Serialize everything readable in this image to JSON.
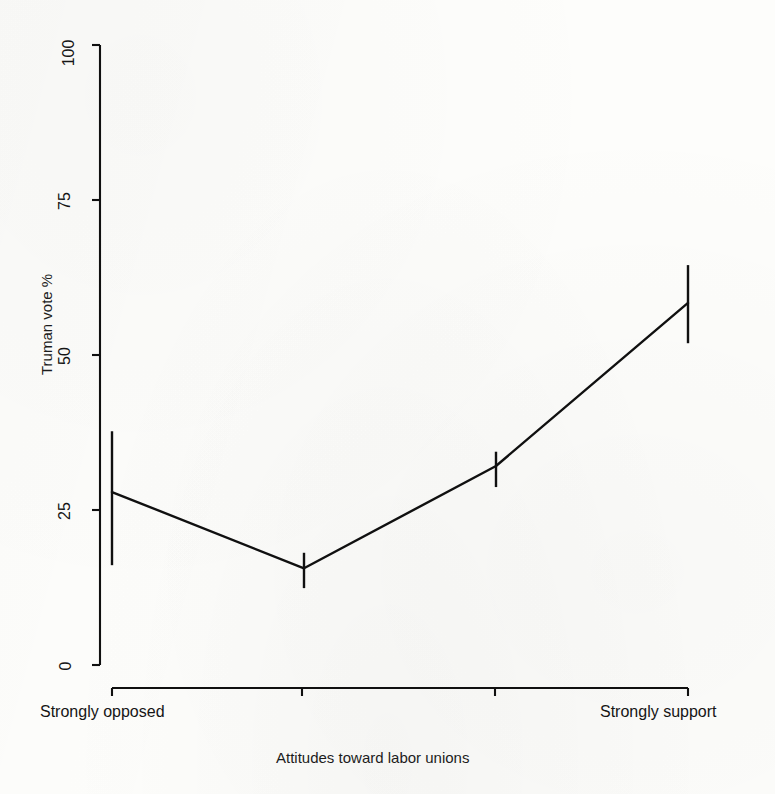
{
  "chart_data": {
    "type": "line",
    "title": "",
    "subtitle": "",
    "xlabel": "Attitudes toward labor unions",
    "ylabel": "Truman vote %",
    "grid": false,
    "legend": "none",
    "error_bars": "vertical confidence intervals",
    "xlim": [
      1,
      4
    ],
    "ylim": [
      0,
      100
    ],
    "yticks": [
      0,
      25,
      50,
      75,
      100
    ],
    "ytick_labels": [
      "0",
      "25",
      "50",
      "75",
      "100"
    ],
    "xticks": [
      1,
      2,
      3,
      4
    ],
    "xtick_labels": [
      "",
      "",
      "",
      ""
    ],
    "x_end_labels": {
      "left": "Strongly opposed",
      "right": "Strongly support"
    },
    "categories": [
      "Strongly opposed",
      "",
      "",
      "Strongly support"
    ],
    "series": [
      {
        "name": "Truman vote %",
        "values": [
          27.9,
          15.6,
          32.1,
          58.4
        ],
        "ci_low": [
          16.1,
          12.4,
          28.7,
          51.9
        ],
        "ci_high": [
          37.7,
          18.1,
          34.4,
          64.5
        ],
        "color": "#101010"
      }
    ]
  },
  "axis": {
    "y_title": "Truman vote %",
    "x_title": "Attitudes toward labor unions",
    "y_ticks": [
      "0",
      "25",
      "50",
      "75",
      "100"
    ],
    "x_left_label": "Strongly opposed",
    "x_right_label": "Strongly support"
  },
  "style": {
    "line_color": "#101010",
    "axis_color": "#101010",
    "background": "#fdfdfb"
  }
}
